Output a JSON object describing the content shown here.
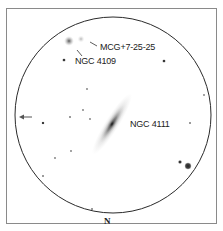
{
  "chart": {
    "orientation_label": "N",
    "direction_arrow": "west-arrow",
    "field_circle": {
      "cx": 113,
      "cy": 115,
      "r": 98
    },
    "objects": [
      {
        "name": "NGC 4111",
        "type": "edge-on galaxy",
        "x": 112,
        "y": 124
      },
      {
        "name": "NGC 4109",
        "type": "faint galaxy",
        "x": 69,
        "y": 41
      },
      {
        "name": "MCG+7-25-25",
        "type": "faint galaxy",
        "x": 81,
        "y": 39
      }
    ],
    "labels": {
      "ngc4111": "NGC 4111",
      "ngc4109": "NGC 4109",
      "mcg": "MCG+7-25-25",
      "north": "N"
    },
    "stars": [
      {
        "x": 64,
        "y": 60,
        "r": 1.6
      },
      {
        "x": 164,
        "y": 61,
        "r": 1.6
      },
      {
        "x": 87,
        "y": 89,
        "r": 0.9
      },
      {
        "x": 204,
        "y": 95,
        "r": 0.9
      },
      {
        "x": 83,
        "y": 110,
        "r": 0.9
      },
      {
        "x": 70,
        "y": 117,
        "r": 1.0
      },
      {
        "x": 90,
        "y": 119,
        "r": 0.9
      },
      {
        "x": 43,
        "y": 123,
        "r": 1.3
      },
      {
        "x": 190,
        "y": 123,
        "r": 1.0
      },
      {
        "x": 71,
        "y": 151,
        "r": 0.9
      },
      {
        "x": 55,
        "y": 158,
        "r": 0.9
      },
      {
        "x": 43,
        "y": 176,
        "r": 1.0
      },
      {
        "x": 180,
        "y": 162,
        "r": 1.8
      },
      {
        "x": 188,
        "y": 166,
        "r": 3.2
      },
      {
        "x": 92,
        "y": 209,
        "r": 1.0
      }
    ]
  }
}
